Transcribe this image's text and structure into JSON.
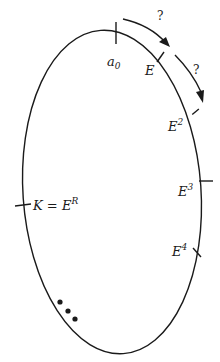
{
  "diagram": {
    "type": "cycle-ellipse",
    "stroke_color": "#1a1a1a",
    "points": [
      {
        "id": "a0",
        "base": "a",
        "sub": "0",
        "sup": ""
      },
      {
        "id": "E",
        "base": "E",
        "sub": "",
        "sup": ""
      },
      {
        "id": "E2",
        "base": "E",
        "sub": "",
        "sup": "2"
      },
      {
        "id": "E3",
        "base": "E",
        "sub": "",
        "sup": "3"
      },
      {
        "id": "E4",
        "base": "E",
        "sub": "",
        "sup": "4"
      },
      {
        "id": "K",
        "label_prefix": "K = ",
        "base": "E",
        "sub": "",
        "sup": "R"
      }
    ],
    "arrows": [
      {
        "from": "a0",
        "to": "E",
        "label": "?"
      },
      {
        "from": "E",
        "to": "E2",
        "label": "?"
      }
    ],
    "continuation": "•••"
  }
}
